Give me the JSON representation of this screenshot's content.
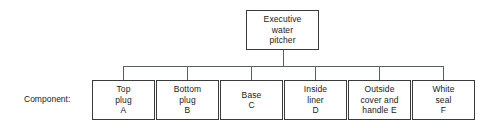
{
  "diagram": {
    "type": "tree",
    "root": {
      "name": "root-node",
      "lines": [
        "Executive",
        "water",
        "pitcher"
      ]
    },
    "row_label": "Component:",
    "components": [
      {
        "name": "box-top-plug",
        "lines": [
          "Top",
          "plug",
          "A"
        ]
      },
      {
        "name": "box-bottom-plug",
        "lines": [
          "Bottom",
          "plug",
          "B"
        ]
      },
      {
        "name": "box-base",
        "lines": [
          "Base",
          "C"
        ]
      },
      {
        "name": "box-inside-liner",
        "lines": [
          "Inside",
          "liner",
          "D"
        ]
      },
      {
        "name": "box-outside-cover",
        "lines": [
          "Outside",
          "cover and",
          "handle E"
        ]
      },
      {
        "name": "box-white-seal",
        "lines": [
          "White",
          "seal",
          "F"
        ]
      }
    ],
    "colors": {
      "background": "#ffffff",
      "box_border": "#3a3a3a",
      "connector": "#555f66",
      "text": "#1a1a1a"
    }
  }
}
